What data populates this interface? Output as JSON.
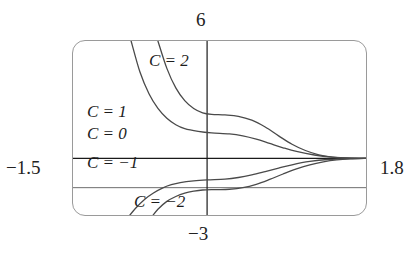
{
  "window": {
    "ymax_label": "6",
    "ymin_label": "−3",
    "xmin_label": "−1.5",
    "xmax_label": "1.8"
  },
  "curve_labels": [
    {
      "id": "c2",
      "text": "C = 2"
    },
    {
      "id": "c1",
      "text": "C = 1"
    },
    {
      "id": "c0",
      "text": "C = 0"
    },
    {
      "id": "cm1",
      "text": "C = −1"
    },
    {
      "id": "cm2",
      "text": "C = −2"
    }
  ],
  "colors": {
    "curve": "#4a4a4a",
    "axis": "#1a1a1a",
    "gridline": "#6e6e6e",
    "frame": "#9a9a9a",
    "background": "#ffffff",
    "text": "#1c1c1c"
  },
  "chart_data": {
    "type": "line",
    "title": "",
    "xlabel": "",
    "ylabel": "",
    "xlim": [
      -1.5,
      1.8
    ],
    "ylim": [
      -3,
      6
    ],
    "grid": true,
    "legend": "inline-curve-labels",
    "axes": {
      "x_axis_at_y": 0,
      "y_axis_at_x": 0,
      "extra_horizontal_gridline_y": -1.5
    },
    "series": [
      {
        "name": "C = 2",
        "plateau_y": 2.25,
        "points": [
          [
            -0.55,
            6.0
          ],
          [
            -0.45,
            4.6
          ],
          [
            -0.35,
            3.6
          ],
          [
            -0.25,
            2.95
          ],
          [
            -0.15,
            2.55
          ],
          [
            -0.05,
            2.33
          ],
          [
            0.05,
            2.25
          ],
          [
            0.2,
            2.22
          ],
          [
            0.35,
            2.15
          ],
          [
            0.5,
            1.95
          ],
          [
            0.65,
            1.6
          ],
          [
            0.8,
            1.15
          ],
          [
            0.95,
            0.72
          ],
          [
            1.1,
            0.4
          ],
          [
            1.25,
            0.18
          ],
          [
            1.4,
            0.06
          ],
          [
            1.55,
            0.02
          ],
          [
            1.8,
            0.0
          ]
        ]
      },
      {
        "name": "C = 1",
        "plateau_y": 1.3,
        "points": [
          [
            -0.85,
            6.0
          ],
          [
            -0.75,
            4.4
          ],
          [
            -0.65,
            3.3
          ],
          [
            -0.55,
            2.55
          ],
          [
            -0.45,
            2.05
          ],
          [
            -0.35,
            1.72
          ],
          [
            -0.25,
            1.52
          ],
          [
            -0.1,
            1.38
          ],
          [
            0.05,
            1.3
          ],
          [
            0.25,
            1.25
          ],
          [
            0.4,
            1.15
          ],
          [
            0.55,
            0.98
          ],
          [
            0.7,
            0.76
          ],
          [
            0.85,
            0.54
          ],
          [
            1.0,
            0.35
          ],
          [
            1.2,
            0.17
          ],
          [
            1.4,
            0.06
          ],
          [
            1.6,
            0.01
          ],
          [
            1.8,
            0.0
          ]
        ]
      },
      {
        "name": "C = 0",
        "plateau_y": 0.0,
        "points": [
          [
            -1.5,
            0.0
          ],
          [
            -0.75,
            0.0
          ],
          [
            0.0,
            0.0
          ],
          [
            0.75,
            0.0
          ],
          [
            1.8,
            0.0
          ]
        ]
      },
      {
        "name": "C = −1",
        "plateau_y": -1.1,
        "points": [
          [
            -0.88,
            -3.0
          ],
          [
            -0.8,
            -2.55
          ],
          [
            -0.7,
            -2.1
          ],
          [
            -0.6,
            -1.77
          ],
          [
            -0.5,
            -1.52
          ],
          [
            -0.4,
            -1.35
          ],
          [
            -0.3,
            -1.24
          ],
          [
            -0.15,
            -1.15
          ],
          [
            0.0,
            -1.1
          ],
          [
            0.2,
            -1.06
          ],
          [
            0.35,
            -0.98
          ],
          [
            0.5,
            -0.85
          ],
          [
            0.65,
            -0.68
          ],
          [
            0.8,
            -0.5
          ],
          [
            0.95,
            -0.33
          ],
          [
            1.15,
            -0.16
          ],
          [
            1.35,
            -0.06
          ],
          [
            1.6,
            -0.01
          ],
          [
            1.8,
            0.0
          ]
        ]
      },
      {
        "name": "C = −2",
        "plateau_y": -1.6,
        "points": [
          [
            -0.62,
            -3.0
          ],
          [
            -0.55,
            -2.6
          ],
          [
            -0.45,
            -2.2
          ],
          [
            -0.35,
            -1.95
          ],
          [
            -0.25,
            -1.78
          ],
          [
            -0.15,
            -1.68
          ],
          [
            -0.05,
            -1.62
          ],
          [
            0.1,
            -1.6
          ],
          [
            0.25,
            -1.58
          ],
          [
            0.4,
            -1.5
          ],
          [
            0.55,
            -1.33
          ],
          [
            0.7,
            -1.08
          ],
          [
            0.85,
            -0.8
          ],
          [
            1.0,
            -0.54
          ],
          [
            1.15,
            -0.33
          ],
          [
            1.3,
            -0.18
          ],
          [
            1.45,
            -0.08
          ],
          [
            1.6,
            -0.03
          ],
          [
            1.8,
            0.0
          ]
        ]
      }
    ]
  }
}
